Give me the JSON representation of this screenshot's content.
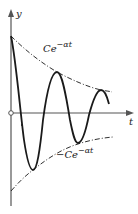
{
  "diagram": {
    "axes": {
      "y_label": "y",
      "x_label": "t"
    },
    "envelopes": {
      "upper": {
        "label_base": "Ce",
        "label_exp": "−αt"
      },
      "lower": {
        "label_base": "−Ce",
        "label_exp": "−αt"
      }
    },
    "colors": {
      "stroke": "#1a1a1a",
      "axis": "#555555",
      "background": "#ffffff"
    }
  }
}
